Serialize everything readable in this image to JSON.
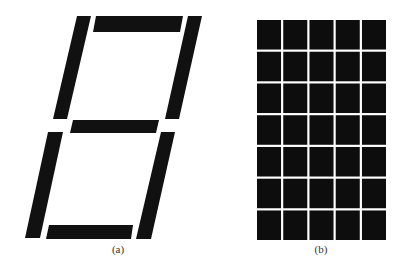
{
  "figure": {
    "panels": [
      {
        "id": "a",
        "caption": "(a)",
        "description": "Seven-segment display (italic/slanted) with all segments lit",
        "segments": [
          {
            "name": "top",
            "points": "96,16 183,16 180,32 93,32"
          },
          {
            "name": "upper-left",
            "points": "77,16 91,16 67,119 53,119"
          },
          {
            "name": "upper-right",
            "points": "188,16 202,16 179,119 165,119"
          },
          {
            "name": "middle",
            "points": "73,120 159,120 156,133 70,133"
          },
          {
            "name": "lower-left",
            "points": "48,132 63,132 40,238 25,238"
          },
          {
            "name": "lower-right",
            "points": "161,132 175,132 151,239 136,239"
          },
          {
            "name": "bottom",
            "points": "49,225 133,225 131,239 46,239"
          }
        ],
        "caption_x": 118,
        "caption_y": 243
      },
      {
        "id": "b",
        "caption": "(b)",
        "description": "5x7 dot-matrix display with all cells lit",
        "grid": {
          "cols": 5,
          "rows": 7,
          "x": 257,
          "y": 20,
          "width": 129,
          "height": 220,
          "gap": 2.2
        },
        "caption_x": 321,
        "caption_y": 243
      }
    ],
    "colors": {
      "segment": "#111111",
      "background": "#ffffff"
    }
  }
}
